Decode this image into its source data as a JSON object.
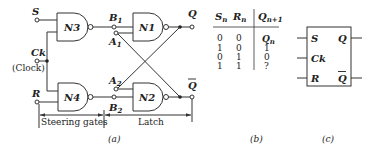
{
  "figure": {
    "part_a": {
      "caption": "(a)",
      "inputs": {
        "S": "S",
        "Ck": "Ck",
        "Ck_note": "(Clock)",
        "R": "R"
      },
      "gates": {
        "N3": "N3",
        "N4": "N4",
        "N1": "N1",
        "N2": "N2"
      },
      "nodes": {
        "B1": "B",
        "B1_sub": "1",
        "A1": "A",
        "A1_sub": "1",
        "A2": "A",
        "A2_sub": "2",
        "B2": "B",
        "B2_sub": "2"
      },
      "outputs": {
        "Q": "Q",
        "Qbar": "Q"
      },
      "sections": {
        "steering": "Steering gates",
        "latch": "Latch"
      }
    },
    "part_b": {
      "caption": "(b)",
      "headers": [
        {
          "main": "S",
          "sub": "n"
        },
        {
          "main": "R",
          "sub": "n"
        },
        {
          "main": "Q",
          "sub": "n+1"
        }
      ],
      "rows": [
        {
          "s": "0",
          "r": "0",
          "q": "Q",
          "q_sub": "n"
        },
        {
          "s": "1",
          "r": "0",
          "q": "1",
          "q_sub": ""
        },
        {
          "s": "0",
          "r": "1",
          "q": "0",
          "q_sub": ""
        },
        {
          "s": "1",
          "r": "1",
          "q": "?",
          "q_sub": ""
        }
      ]
    },
    "part_c": {
      "caption": "(c)",
      "pins_left": [
        "S",
        "Ck",
        "R"
      ],
      "pins_right": [
        "Q",
        "Q"
      ]
    }
  }
}
